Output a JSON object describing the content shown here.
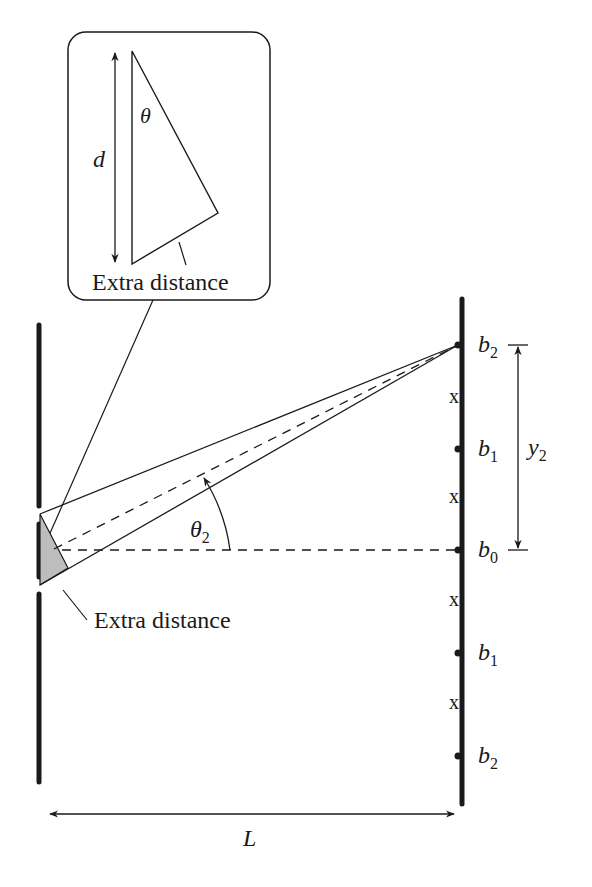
{
  "figure": {
    "type": "double-slit interference geometry",
    "colors": {
      "ink": "#1a1a1a",
      "shade": "#bdbdbd",
      "background": "#ffffff"
    }
  },
  "inset": {
    "d_label": "d",
    "theta_label": "θ",
    "extra_distance_label": "Extra distance"
  },
  "main": {
    "extra_distance_label": "Extra distance",
    "angle_label_base": "θ",
    "angle_label_sub": "2",
    "distance_label": "L",
    "y_label_base": "y",
    "y_label_sub": "2"
  },
  "screen": {
    "points": [
      {
        "base": "b",
        "sub": "2",
        "position": "top"
      },
      {
        "base": "b",
        "sub": "1",
        "position": "upper"
      },
      {
        "base": "b",
        "sub": "0",
        "position": "center"
      },
      {
        "base": "b",
        "sub": "1",
        "position": "lower"
      },
      {
        "base": "b",
        "sub": "2",
        "position": "bottom"
      }
    ],
    "minima_mark": "x"
  }
}
